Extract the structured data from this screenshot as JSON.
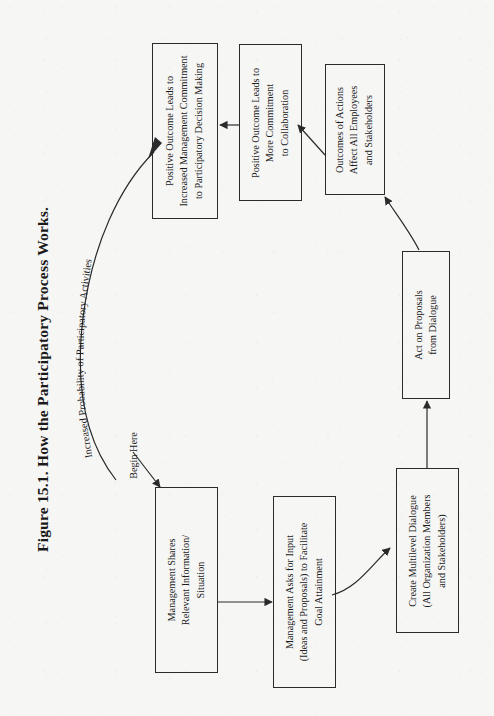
{
  "figure": {
    "title": "Figure 15.1.  How the Participatory Process Works.",
    "background_color": "#f6f6f5",
    "line_color": "#2b2b2b"
  },
  "labels": {
    "begin_here": "Begin Here",
    "feedback_arc": "Increased Probability of Participatory Activities"
  },
  "nodes": [
    {
      "id": "management-shares",
      "lines": [
        "Management Shares",
        "Relevant Information/",
        "Situation"
      ]
    },
    {
      "id": "management-asks",
      "lines": [
        "Management Asks for Input",
        "(Ideas and Proposals) to Facilitate",
        "Goal Attainment"
      ]
    },
    {
      "id": "create-dialogue",
      "lines": [
        "Create Multilevel Dialogue",
        "(All Organization Members",
        "and Stakeholders)"
      ]
    },
    {
      "id": "act-on-proposals",
      "lines": [
        "Act on Proposals",
        "from Dialogue"
      ]
    },
    {
      "id": "outcomes-affect",
      "lines": [
        "Outcomes of Actions",
        "Affect All Employees",
        "and Stakeholders"
      ]
    },
    {
      "id": "positive-more-commitment",
      "lines": [
        "Positive Outcome Leads to",
        "More Commitment",
        "to Collaboration"
      ]
    },
    {
      "id": "positive-increased-commitment",
      "lines": [
        "Positive Outcome Leads to",
        "Increased Management Commitment",
        "to Participatory Decision Making"
      ]
    }
  ]
}
